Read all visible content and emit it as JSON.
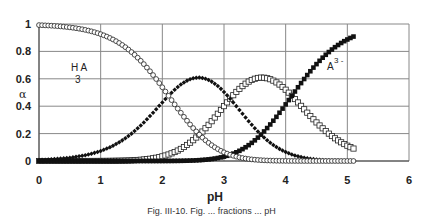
{
  "chart_data": {
    "type": "scatter",
    "title": "",
    "xlabel": "pH",
    "ylabel": "α",
    "xlim": [
      0,
      6
    ],
    "ylim": [
      0,
      1
    ],
    "x_ticks": [
      "0",
      "1",
      "2",
      "3",
      "4",
      "5",
      "6"
    ],
    "y_ticks": [
      "0",
      "0.2",
      "0.4",
      "0.6",
      "0.8",
      "1"
    ],
    "grid": true,
    "legend": "none (inline annotations)",
    "model": {
      "pKa": [
        2.1,
        3.1,
        4.1
      ],
      "x_start": 0,
      "x_end": 5.1,
      "x_step": 0.05
    },
    "annotations": [
      {
        "text": "H",
        "sub": "3",
        "text2": "A",
        "x": 0.95,
        "y": 0.8
      },
      {
        "text": "A",
        "sup": "3 -",
        "x": 4.7,
        "y": 0.68
      }
    ],
    "series": [
      {
        "name": "H3A",
        "marker": "open-circle",
        "key_points": [
          [
            0,
            0.99
          ],
          [
            1,
            0.93
          ],
          [
            2,
            0.55
          ],
          [
            2.1,
            0.5
          ],
          [
            3,
            0.1
          ],
          [
            4,
            0.005
          ],
          [
            5.1,
            0.0
          ]
        ]
      },
      {
        "name": "H2A-",
        "marker": "filled-diamond",
        "key_points": [
          [
            0,
            0.01
          ],
          [
            1,
            0.07
          ],
          [
            2,
            0.44
          ],
          [
            2.6,
            0.62
          ],
          [
            3,
            0.55
          ],
          [
            4,
            0.12
          ],
          [
            5.1,
            0.01
          ]
        ]
      },
      {
        "name": "HA2-",
        "marker": "open-square",
        "key_points": [
          [
            0,
            0.0
          ],
          [
            2,
            0.01
          ],
          [
            3,
            0.38
          ],
          [
            3.6,
            0.61
          ],
          [
            4,
            0.52
          ],
          [
            5,
            0.11
          ],
          [
            5.1,
            0.08
          ]
        ]
      },
      {
        "name": "A3-",
        "marker": "filled-square",
        "key_points": [
          [
            0,
            0.0
          ],
          [
            3,
            0.03
          ],
          [
            3.5,
            0.15
          ],
          [
            4,
            0.4
          ],
          [
            4.5,
            0.71
          ],
          [
            5.1,
            0.92
          ]
        ]
      }
    ]
  },
  "axes": {
    "x_label": "pH",
    "y_label": "α",
    "x_ticks": [
      "0",
      "1",
      "2",
      "3",
      "4",
      "5",
      "6"
    ],
    "y_ticks": [
      "0",
      "0.2",
      "0.4",
      "0.6",
      "0.8",
      "1"
    ]
  },
  "labels": {
    "h3a_main": "H A",
    "h3a_sub": "3",
    "a3_main": "A",
    "a3_sup": "3 -"
  },
  "caption": "Fig. III-10. Fig. ... fractions ... pH"
}
